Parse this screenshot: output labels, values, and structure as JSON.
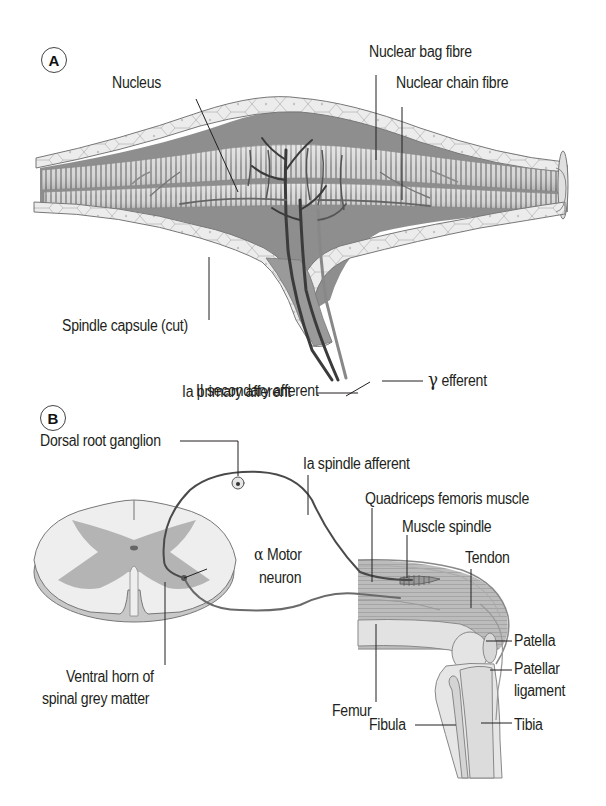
{
  "figure": {
    "panels": [
      {
        "id": "A",
        "badge": "A",
        "subject": "Muscle spindle structure",
        "labels": {
          "nucleus": "Nucleus",
          "nuclear_bag_fibre": "Nuclear bag fibre",
          "nuclear_chain_fibre": "Nuclear chain fibre",
          "spindle_capsule": "Spindle capsule (cut)",
          "ia_primary_afferent": "Ia primary afferent",
          "gamma_efferent_symbol": "γ",
          "gamma_efferent": "efferent",
          "ii_secondary_afferent": "II secondary afferent"
        }
      },
      {
        "id": "B",
        "badge": "B",
        "subject": "Stretch reflex pathway",
        "labels": {
          "dorsal_root_ganglion": "Dorsal root ganglion",
          "ia_spindle_afferent": "Ia spindle afferent",
          "quadriceps": "Quadriceps femoris muscle",
          "muscle_spindle": "Muscle spindle",
          "tendon": "Tendon",
          "alpha_symbol": "α",
          "motor_neuron_line1": "Motor",
          "motor_neuron_line2": "neuron",
          "ventral_horn_line1": "Ventral horn of",
          "ventral_horn_line2": "spinal grey matter",
          "patella": "Patella",
          "patellar_ligament_line1": "Patellar",
          "patellar_ligament_line2": "ligament",
          "femur": "Femur",
          "fibula": "Fibula",
          "tibia": "Tibia"
        }
      }
    ],
    "colors": {
      "background": "#ffffff",
      "text": "#231f20",
      "leader_line": "#231f20",
      "capsule_fill": "#e9e9e9",
      "capsule_pattern": "#bdbdbd",
      "fibre_light": "#d4d4d4",
      "fibre_stripe": "#8f8f8f",
      "interior_dark": "#8a8a8a",
      "nerve_dark": "#3b3b3b",
      "nerve_mid": "#6a6a6a",
      "cord_white": "#eeeeee",
      "cord_grey": "#b5b5b5",
      "bone_fill": "#e2e2e2",
      "muscle_fill": "#bdbdbd"
    }
  }
}
